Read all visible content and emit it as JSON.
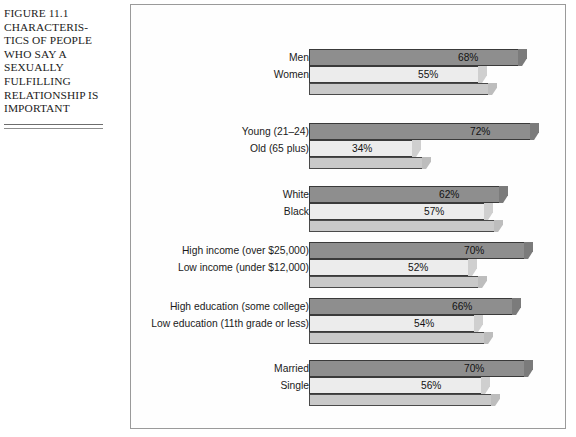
{
  "caption": {
    "lines": [
      "FIGURE 11.1",
      "CHARACTERIS-",
      "TICS OF PEOPLE",
      "WHO SAY A",
      "SEXUALLY",
      "FULFILLING",
      "RELATIONSHIP IS",
      "IMPORTANT"
    ]
  },
  "chart_data": {
    "type": "bar",
    "orientation": "horizontal",
    "xlabel": "",
    "ylabel": "",
    "xlim": [
      0,
      100
    ],
    "grid": false,
    "legend": false,
    "value_suffix": "%",
    "categories": [
      "Men",
      "Women",
      "Young (21–24)",
      "Old (65 plus)",
      "White",
      "Black",
      "High income (over $25,000)",
      "Low income (under $12,000)",
      "High education (some college)",
      "Low education (11th grade or less)",
      "Married",
      "Single"
    ],
    "values": [
      68,
      55,
      72,
      34,
      62,
      57,
      70,
      52,
      66,
      54,
      70,
      56
    ],
    "groups": [
      {
        "name": "gender",
        "bars": [
          {
            "label": "Men",
            "value": 68,
            "value_label": "68%",
            "shade": "dark"
          },
          {
            "label": "Women",
            "value": 55,
            "value_label": "55%",
            "shade": "light"
          }
        ]
      },
      {
        "name": "age",
        "bars": [
          {
            "label": "Young (21–24)",
            "value": 72,
            "value_label": "72%",
            "shade": "dark"
          },
          {
            "label": "Old (65 plus)",
            "value": 34,
            "value_label": "34%",
            "shade": "light"
          }
        ]
      },
      {
        "name": "race",
        "bars": [
          {
            "label": "White",
            "value": 62,
            "value_label": "62%",
            "shade": "dark"
          },
          {
            "label": "Black",
            "value": 57,
            "value_label": "57%",
            "shade": "light"
          }
        ]
      },
      {
        "name": "income",
        "bars": [
          {
            "label": "High income (over $25,000)",
            "value": 70,
            "value_label": "70%",
            "shade": "dark"
          },
          {
            "label": "Low income (under $12,000)",
            "value": 52,
            "value_label": "52%",
            "shade": "light"
          }
        ]
      },
      {
        "name": "education",
        "bars": [
          {
            "label": "High education (some college)",
            "value": 66,
            "value_label": "66%",
            "shade": "dark"
          },
          {
            "label": "Low education (11th grade or less)",
            "value": 54,
            "value_label": "54%",
            "shade": "light"
          }
        ]
      },
      {
        "name": "marital-status",
        "bars": [
          {
            "label": "Married",
            "value": 70,
            "value_label": "70%",
            "shade": "dark"
          },
          {
            "label": "Single",
            "value": 56,
            "value_label": "56%",
            "shade": "light"
          }
        ]
      }
    ]
  },
  "colors": {
    "bar_dark": "#8e8e8e",
    "bar_light": "#ececec",
    "base_plate": "#c9c9c9",
    "frame_border": "#9a9a9a",
    "text": "#1a1a1a"
  }
}
